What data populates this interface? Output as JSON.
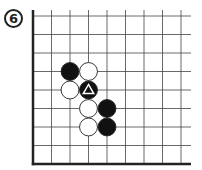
{
  "diagram": {
    "label": "6",
    "board": {
      "columns": 9,
      "rows": 9,
      "origin_x": 33,
      "origin_y": 16,
      "spacing": 18.5,
      "right_extent": 191,
      "edges": {
        "left": true,
        "bottom": true,
        "top": false,
        "right": false
      },
      "colors": {
        "line": "#444444",
        "edge": "#222222",
        "black": "#111111",
        "white": "#ffffff",
        "stone_outline": "#222222"
      }
    },
    "stones": [
      {
        "color": "black",
        "col": 2,
        "row": 3,
        "marker": ""
      },
      {
        "color": "white",
        "col": 3,
        "row": 3,
        "marker": ""
      },
      {
        "color": "white",
        "col": 2,
        "row": 4,
        "marker": ""
      },
      {
        "color": "black",
        "col": 3,
        "row": 4,
        "marker": "triangle"
      },
      {
        "color": "white",
        "col": 3,
        "row": 5,
        "marker": ""
      },
      {
        "color": "black",
        "col": 4,
        "row": 5,
        "marker": ""
      },
      {
        "color": "white",
        "col": 3,
        "row": 6,
        "marker": ""
      },
      {
        "color": "black",
        "col": 4,
        "row": 6,
        "marker": ""
      }
    ]
  }
}
